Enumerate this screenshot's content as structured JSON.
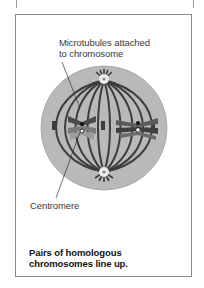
{
  "figure": {
    "labels": {
      "microtubules": "Microtubules attached\nto chromosome",
      "centromere": "Centromere"
    },
    "caption": "Pairs of homologous\nchromosomes line up.",
    "colors": {
      "cytoplasm": "#b8b8b8",
      "cytoplasm_edge": "#a6a6a6",
      "spindle_fibers": "#3c3c3c",
      "chromosome_dark": "#4a4a4a",
      "chromosome_mid": "#7a7a7a",
      "chromosome_light": "#9c9c9c",
      "centrosome": "#e8e8e8",
      "panel_border": "#8a8a8a",
      "text": "#3a3a3a"
    }
  }
}
